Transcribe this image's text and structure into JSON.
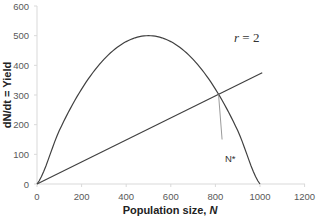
{
  "chart_data": {
    "type": "line",
    "title": "",
    "xlabel": "Population size, N",
    "ylabel": "dN/dt = Yield",
    "xlim": [
      0,
      1200
    ],
    "ylim": [
      0,
      600
    ],
    "x_ticks": [
      0,
      200,
      400,
      600,
      800,
      1000,
      1200
    ],
    "y_ticks": [
      0,
      100,
      200,
      300,
      400,
      500,
      600
    ],
    "grid": false,
    "legend": null,
    "series": [
      {
        "name": "Logistic yield curve (r = 2)",
        "kind": "curve",
        "x": [
          0,
          100,
          200,
          300,
          400,
          500,
          600,
          700,
          800,
          900,
          1000
        ],
        "y": [
          0,
          180,
          320,
          420,
          480,
          500,
          480,
          420,
          320,
          180,
          0
        ]
      },
      {
        "name": "Harvest line",
        "kind": "line",
        "x": [
          0,
          1010
        ],
        "y": [
          0,
          375
        ]
      },
      {
        "name": "N* drop line",
        "kind": "line",
        "x": [
          814,
          830
        ],
        "y": [
          303,
          150
        ]
      }
    ],
    "annotations": [
      {
        "text": "r = 2",
        "x": 880,
        "y": 490
      },
      {
        "text": "N*",
        "x": 830,
        "y": 130
      }
    ]
  },
  "labels": {
    "xlabel_main": "Population size, ",
    "xlabel_var": "N",
    "ylabel": "dN/dt = Yield",
    "r_var": "r",
    "r_eq": " = 2",
    "nstar": "N*"
  }
}
